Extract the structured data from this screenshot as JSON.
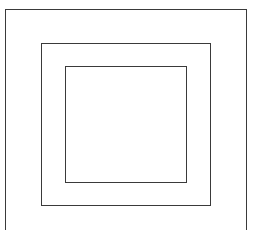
{
  "diagram": {
    "type": "nested-squares",
    "shapes": [
      {
        "name": "outer-square",
        "stroke": "#3a3a3a",
        "fill": "#ffffff"
      },
      {
        "name": "middle-square",
        "stroke": "#3a3a3a",
        "fill": "#ffffff"
      },
      {
        "name": "inner-square",
        "stroke": "#3a3a3a",
        "fill": "#ffffff"
      }
    ]
  }
}
